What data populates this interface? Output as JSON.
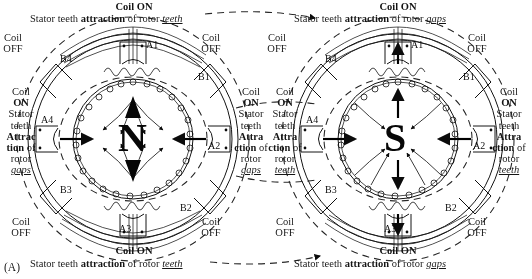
{
  "figure": {
    "label": "(A)",
    "panels": [
      {
        "id": "left-panel",
        "rotor_polarity": "N",
        "top_caption": {
          "coil_state": "Coil ON",
          "text_pre": "Stator teeth ",
          "text_bold": "attraction",
          "text_mid": " of rotor ",
          "text_em": "teeth"
        },
        "bottom_caption": {
          "coil_state": "Coil ON",
          "text_pre": "Stator teeth ",
          "text_bold": "attraction",
          "text_mid": " of rotor ",
          "text_em": "teeth"
        },
        "left_caption": {
          "line1": "Coil",
          "line2": "ON",
          "line3": "Stator",
          "line4": "teeth",
          "line5": "Attrac",
          "line6": "tion",
          "line6_tail": " of",
          "line7": "rotor",
          "line8": "gaps"
        },
        "right_caption": {
          "line1": "Coil",
          "line2": "ON",
          "line3": "Stator",
          "line4": "teeth",
          "line5": "Attra",
          "line6": "ction",
          "line6_tail": " of",
          "line7": "rotor",
          "line8": "gaps"
        },
        "corner_labels": [
          {
            "name": "top-left",
            "line1": "Coil",
            "line2": "OFF"
          },
          {
            "name": "top-right",
            "line1": "Coil",
            "line2": "OFF"
          },
          {
            "name": "bottom-left",
            "line1": "Coil",
            "line2": "OFF"
          },
          {
            "name": "bottom-right",
            "line1": "Coil",
            "line2": "OFF"
          }
        ],
        "poles": [
          "A1",
          "A2",
          "A3",
          "A4",
          "B1",
          "B2",
          "B3",
          "B4"
        ]
      },
      {
        "id": "right-panel",
        "rotor_polarity": "S",
        "top_caption": {
          "coil_state": "Coil ON",
          "text_pre": "Stator teeth ",
          "text_bold": "attraction",
          "text_mid": " of rotor ",
          "text_em": "gaps"
        },
        "bottom_caption": {
          "coil_state": "Coil ON",
          "text_pre": "Stator teeth ",
          "text_bold": "attraction",
          "text_mid": " of rotor ",
          "text_em": "gaps"
        },
        "left_caption": {
          "line1": "Coil",
          "line2": "ON",
          "line3": "Stator",
          "line4": "teeth",
          "line5": "Attra",
          "line6": "ction",
          "line6_tail": " of",
          "line7": "rotor",
          "line8": "teeth"
        },
        "right_caption": {
          "line1": "Coil",
          "line2": "ON",
          "line3": "Stator",
          "line4": "teeth",
          "line5": "Attra",
          "line6": "ction",
          "line6_tail": " of",
          "line7": "rotor",
          "line8": "teeth"
        },
        "corner_labels": [
          {
            "name": "top-left",
            "line1": "Coil",
            "line2": "OFF"
          },
          {
            "name": "top-right",
            "line1": "Coil",
            "line2": "OFF"
          },
          {
            "name": "bottom-left",
            "line1": "Coil",
            "line2": "OFF"
          },
          {
            "name": "bottom-right",
            "line1": "Coil",
            "line2": "OFF"
          }
        ],
        "poles": [
          "A1",
          "A2",
          "A3",
          "A4",
          "B1",
          "B2",
          "B3",
          "B4"
        ]
      }
    ]
  },
  "colors": {
    "ink": "#141414",
    "dashed": "#2b2b2b"
  }
}
